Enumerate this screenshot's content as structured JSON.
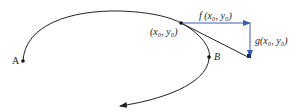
{
  "diagram": {
    "labels": {
      "point": "(x₀, y₀)",
      "f": "f (x₀, y₀)",
      "g": "g(x₀, y₀)",
      "A": "A",
      "B": "B"
    },
    "colors": {
      "curve": "#222222",
      "vector": "#3a5fb0"
    }
  }
}
